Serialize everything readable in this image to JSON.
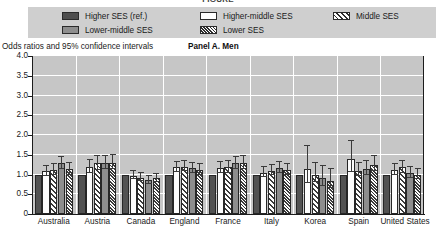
{
  "figure": {
    "cropped_title": "FIGURE",
    "axis_title": "Odds ratios and 95% confidence intervals",
    "panel_label": "Panel A. Men"
  },
  "legend": {
    "items": [
      {
        "label": "Higher SES (ref.)",
        "key": "higher",
        "swatch": "solid-dark-gray"
      },
      {
        "label": "Higher-middle SES",
        "key": "highermid",
        "swatch": "white-empty"
      },
      {
        "label": "Middle SES",
        "key": "middle",
        "swatch": "wide-diagonal-hatch"
      },
      {
        "label": "Lower-middle SES",
        "key": "lowermid",
        "swatch": "solid-medium-gray"
      },
      {
        "label": "Lower SES",
        "key": "lower",
        "swatch": "dense-diagonal-hatch"
      }
    ]
  },
  "colors": {
    "plot_background": "#c6c6c6",
    "legend_background": "#cfcfcf",
    "gridline": "#ffffff",
    "axis": "#1c1c1c",
    "higher_ses": "#525252",
    "higher_middle_ses": "#fdfdfd",
    "lower_middle_ses": "#8d8d8d",
    "hatch_ink": "#3a3a3a"
  },
  "chart_data": {
    "type": "bar",
    "title": "Panel A. Men",
    "xlabel": "",
    "ylabel": "Odds ratios and 95% confidence intervals",
    "ylim": [
      0,
      4.0
    ],
    "yticks": [
      "0",
      "0.5",
      "1.0",
      "1.5",
      "2.0",
      "2.5",
      "3.0",
      "3.5",
      "4.0"
    ],
    "ytick_values": [
      0,
      0.5,
      1.0,
      1.5,
      2.0,
      2.5,
      3.0,
      3.5,
      4.0
    ],
    "grid": "horizontal-white-gridlines",
    "legend_position": "top",
    "error_bars": "95% confidence intervals",
    "categories": [
      "Australia",
      "Austria",
      "Canada",
      "England",
      "France",
      "Italy",
      "Korea",
      "Spain",
      "United States"
    ],
    "series": [
      {
        "name": "Higher SES (ref.)",
        "values": [
          1.0,
          1.0,
          1.0,
          1.0,
          1.0,
          1.0,
          1.0,
          1.0,
          1.0
        ],
        "ci_low": [
          1.0,
          1.0,
          1.0,
          1.0,
          1.0,
          1.0,
          1.0,
          1.0,
          1.0
        ],
        "ci_high": [
          1.0,
          1.0,
          1.0,
          1.0,
          1.0,
          1.0,
          1.0,
          1.0,
          1.0
        ]
      },
      {
        "name": "Higher-middle SES",
        "values": [
          1.08,
          1.18,
          0.97,
          1.18,
          1.16,
          1.05,
          1.15,
          1.4,
          1.12
        ],
        "ci_low": [
          0.95,
          1.03,
          0.88,
          1.06,
          1.04,
          0.94,
          0.78,
          1.06,
          0.99
        ],
        "ci_high": [
          1.22,
          1.36,
          1.08,
          1.32,
          1.31,
          1.18,
          1.72,
          1.86,
          1.27
        ]
      },
      {
        "name": "Middle SES",
        "values": [
          1.12,
          1.28,
          0.92,
          1.2,
          1.18,
          1.1,
          1.0,
          1.1,
          1.18
        ],
        "ci_low": [
          0.99,
          1.12,
          0.83,
          1.08,
          1.05,
          0.98,
          0.8,
          0.96,
          1.04
        ],
        "ci_high": [
          1.27,
          1.46,
          1.03,
          1.34,
          1.33,
          1.24,
          1.3,
          1.3,
          1.34
        ]
      },
      {
        "name": "Lower-middle SES",
        "values": [
          1.28,
          1.3,
          0.86,
          1.16,
          1.28,
          1.16,
          0.92,
          1.14,
          1.04
        ],
        "ci_low": [
          1.13,
          1.14,
          0.77,
          1.04,
          1.14,
          1.03,
          0.72,
          1.0,
          0.92
        ],
        "ci_high": [
          1.45,
          1.48,
          0.97,
          1.3,
          1.44,
          1.31,
          1.22,
          1.33,
          1.18
        ]
      },
      {
        "name": "Lower SES",
        "values": [
          1.13,
          1.3,
          0.9,
          1.12,
          1.3,
          1.12,
          0.84,
          1.25,
          1.0
        ],
        "ci_low": [
          1.0,
          1.14,
          0.8,
          1.0,
          1.15,
          0.99,
          0.65,
          1.08,
          0.88
        ],
        "ci_high": [
          1.29,
          1.49,
          1.01,
          1.26,
          1.47,
          1.27,
          1.14,
          1.48,
          1.14
        ]
      }
    ]
  }
}
